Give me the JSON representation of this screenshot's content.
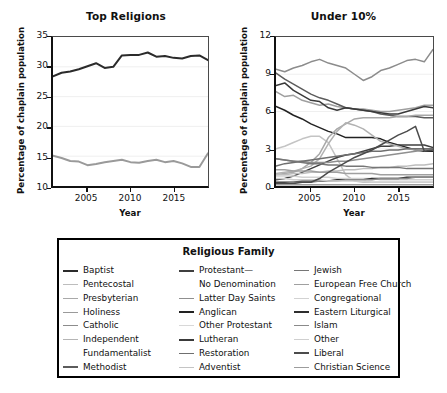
{
  "chart_data": [
    {
      "type": "line",
      "title": "Top Religions",
      "xlabel": "Year",
      "ylabel": "Percentage of chaplain population",
      "xlim": [
        2001,
        2019
      ],
      "ylim": [
        10,
        35
      ],
      "yticks": [
        10,
        15,
        20,
        25,
        30,
        35
      ],
      "xticks": [
        2005,
        2010,
        2015
      ],
      "grid": true,
      "legend_position": "below-shared",
      "x": [
        2001,
        2002,
        2003,
        2004,
        2005,
        2006,
        2007,
        2008,
        2009,
        2010,
        2011,
        2012,
        2013,
        2014,
        2015,
        2016,
        2017,
        2018,
        2019
      ],
      "series": [
        {
          "name": "Baptist",
          "color": "#2b2b2b",
          "values": [
            28.4,
            29.0,
            29.2,
            29.6,
            30.1,
            30.6,
            29.8,
            30.0,
            31.9,
            32.0,
            32.0,
            32.4,
            31.7,
            31.8,
            31.5,
            31.4,
            31.8,
            31.9,
            31.1
          ]
        },
        {
          "name": "Catholic",
          "color": "#9a9a9a",
          "values": [
            15.1,
            14.7,
            14.2,
            14.1,
            13.5,
            13.7,
            14.0,
            14.2,
            14.4,
            14.0,
            13.9,
            14.2,
            14.4,
            14.0,
            14.2,
            13.8,
            13.2,
            13.2,
            15.5
          ]
        }
      ]
    },
    {
      "type": "line",
      "title": "Under 10%",
      "xlabel": "Year",
      "ylabel": "Percentage of chaplain population",
      "xlim": [
        2001,
        2019
      ],
      "ylim": [
        0,
        12
      ],
      "yticks": [
        0,
        3,
        6,
        9,
        12
      ],
      "xticks": [
        2005,
        2010,
        2015
      ],
      "grid": true,
      "legend_position": "below-shared",
      "x": [
        2001,
        2002,
        2003,
        2004,
        2005,
        2006,
        2007,
        2008,
        2009,
        2010,
        2011,
        2012,
        2013,
        2014,
        2015,
        2016,
        2017,
        2018,
        2019
      ],
      "series": [
        {
          "name": "Pentecostal",
          "color": "#8c8c8c",
          "values": [
            9.4,
            9.2,
            9.5,
            9.7,
            10.0,
            10.2,
            9.9,
            9.7,
            9.5,
            9.0,
            8.5,
            8.8,
            9.3,
            9.5,
            9.8,
            10.1,
            10.2,
            10.0,
            11.0
          ]
        },
        {
          "name": "Presbyterian",
          "color": "#9f9f9f",
          "values": [
            7.6,
            7.2,
            7.3,
            6.9,
            6.7,
            6.5,
            6.6,
            6.4,
            6.3,
            6.2,
            6.2,
            6.1,
            6.0,
            6.0,
            6.1,
            6.2,
            6.3,
            6.5,
            6.5
          ]
        },
        {
          "name": "Methodist",
          "color": "#5c5c5c",
          "values": [
            9.1,
            8.6,
            8.2,
            7.8,
            7.4,
            7.1,
            6.9,
            6.6,
            6.3,
            6.2,
            6.1,
            6.0,
            5.8,
            5.7,
            5.6,
            5.6,
            5.6,
            5.5,
            5.5
          ]
        },
        {
          "name": "Lutheran",
          "color": "#3a3a3a",
          "values": [
            8.1,
            8.3,
            7.7,
            7.3,
            6.9,
            6.8,
            6.3,
            6.1,
            6.3,
            6.2,
            6.1,
            6.0,
            5.9,
            5.8,
            5.8,
            6.0,
            6.2,
            6.4,
            6.3
          ]
        },
        {
          "name": "Anglican",
          "color": "#222222",
          "values": [
            6.4,
            6.1,
            5.7,
            5.4,
            5.0,
            4.7,
            4.4,
            4.2,
            3.9,
            3.9,
            3.9,
            3.9,
            3.8,
            3.5,
            3.3,
            3.1,
            2.9,
            2.8,
            2.8
          ]
        },
        {
          "name": "Other Protestant",
          "color": "#c4c4c4",
          "values": [
            3.0,
            3.2,
            3.5,
            3.8,
            4.0,
            4.0,
            3.5,
            2.2,
            0.9,
            0.4,
            0.3,
            0.3,
            0.3,
            0.3,
            0.3,
            0.3,
            0.3,
            0.3,
            0.3
          ]
        },
        {
          "name": "Protestant— No Denomination",
          "color": "#3f3f3f",
          "values": [
            0.5,
            0.6,
            0.8,
            1.1,
            1.4,
            1.7,
            2.0,
            2.3,
            2.5,
            2.6,
            2.8,
            3.0,
            3.2,
            3.2,
            3.3,
            3.3,
            3.3,
            3.3,
            3.1
          ]
        },
        {
          "name": "Holiness",
          "color": "#a8a8a8",
          "values": [
            0.9,
            1.0,
            1.1,
            1.4,
            1.9,
            2.6,
            3.9,
            4.6,
            5.0,
            5.4,
            5.5,
            5.5,
            5.5,
            5.5,
            5.6,
            5.6,
            5.7,
            5.7,
            5.7
          ]
        },
        {
          "name": "Independent Fundamentalist",
          "color": "#b2b2b2",
          "values": [
            1.0,
            1.1,
            1.2,
            1.4,
            1.6,
            2.2,
            3.4,
            4.4,
            5.1,
            4.9,
            4.6,
            4.1,
            3.6,
            3.4,
            3.2,
            3.0,
            2.9,
            2.9,
            2.9
          ]
        },
        {
          "name": "Latter Day Saints",
          "color": "#8f8f8f",
          "values": [
            2.2,
            2.1,
            2.0,
            2.0,
            1.9,
            1.9,
            1.9,
            2.0,
            2.0,
            2.1,
            2.2,
            2.3,
            2.4,
            2.5,
            2.6,
            2.7,
            2.8,
            2.9,
            3.0
          ]
        },
        {
          "name": "Restoration",
          "color": "#6f6f6f",
          "values": [
            1.6,
            1.8,
            1.9,
            2.0,
            2.1,
            2.2,
            2.3,
            2.4,
            2.5,
            2.6,
            2.7,
            2.8,
            2.8,
            2.9,
            2.9,
            3.0,
            3.0,
            3.0,
            3.0
          ]
        },
        {
          "name": "Adventist",
          "color": "#bdbdbd",
          "values": [
            0.9,
            0.9,
            1.0,
            1.0,
            1.1,
            1.1,
            1.2,
            1.2,
            1.3,
            1.3,
            1.4,
            1.4,
            1.5,
            1.5,
            1.6,
            1.6,
            1.7,
            1.7,
            1.8
          ]
        },
        {
          "name": "Jewish",
          "color": "#767676",
          "values": [
            2.2,
            2.1,
            2.0,
            1.9,
            1.8,
            1.8,
            1.7,
            1.7,
            1.6,
            1.6,
            1.6,
            1.5,
            1.5,
            1.5,
            1.5,
            1.4,
            1.4,
            1.4,
            1.4
          ]
        },
        {
          "name": "European Free Church",
          "color": "#a0a0a0",
          "values": [
            1.3,
            1.3,
            1.2,
            1.2,
            1.2,
            1.1,
            1.1,
            1.1,
            1.0,
            1.0,
            1.0,
            1.0,
            0.9,
            0.9,
            0.9,
            0.9,
            0.9,
            0.9,
            0.9
          ]
        },
        {
          "name": "Congregational",
          "color": "#d2d2d2",
          "values": [
            0.8,
            0.8,
            0.8,
            0.7,
            0.7,
            0.7,
            0.7,
            0.6,
            0.6,
            0.6,
            0.6,
            0.6,
            0.5,
            0.5,
            0.5,
            0.5,
            0.5,
            0.5,
            0.5
          ]
        },
        {
          "name": "Eastern Liturgical",
          "color": "#2e2e2e",
          "values": [
            0.3,
            0.3,
            0.3,
            0.4,
            0.4,
            0.4,
            0.4,
            0.5,
            0.5,
            0.5,
            0.5,
            0.6,
            0.6,
            0.6,
            0.6,
            0.7,
            0.7,
            0.7,
            0.7
          ]
        },
        {
          "name": "Islam",
          "color": "#8a8a8a",
          "values": [
            0.2,
            0.2,
            0.3,
            0.3,
            0.3,
            0.4,
            0.4,
            0.4,
            0.5,
            0.5,
            0.5,
            0.5,
            0.6,
            0.6,
            0.6,
            0.6,
            0.7,
            0.7,
            0.7
          ]
        },
        {
          "name": "Other",
          "color": "#cfcfcf",
          "values": [
            0.6,
            0.6,
            0.5,
            0.5,
            0.5,
            0.5,
            0.4,
            0.4,
            0.4,
            0.4,
            0.4,
            0.3,
            0.3,
            0.3,
            0.3,
            0.3,
            0.3,
            0.3,
            0.3
          ]
        },
        {
          "name": "Liberal",
          "color": "#4b4b4b",
          "values": [
            0.2,
            0.2,
            0.2,
            0.3,
            0.3,
            0.6,
            1.1,
            1.5,
            1.9,
            2.3,
            2.6,
            2.9,
            3.3,
            3.7,
            4.1,
            4.4,
            4.8,
            2.8,
            2.9
          ]
        },
        {
          "name": "Christian Science",
          "color": "#9c9c9c",
          "values": [
            0.1,
            0.1,
            0.1,
            0.1,
            0.1,
            0.1,
            0.1,
            0.1,
            0.1,
            0.1,
            0.1,
            0.1,
            0.1,
            0.1,
            0.1,
            0.1,
            0.1,
            0.1,
            0.1
          ]
        }
      ]
    }
  ],
  "left_chart": {
    "title": "Top Religions",
    "xlabel": "Year",
    "ylabel": "Percentage of chaplain population",
    "yticks": [
      "35",
      "30",
      "25",
      "20",
      "15",
      "10"
    ],
    "xticks": [
      "2005",
      "2010",
      "2015"
    ]
  },
  "right_chart": {
    "title": "Under 10%",
    "xlabel": "Year",
    "ylabel": "Percentage of chaplain population",
    "yticks": [
      "12",
      "9",
      "6",
      "3",
      "0"
    ],
    "xticks": [
      "2005",
      "2010",
      "2015"
    ]
  },
  "legend": {
    "title": "Religious Family",
    "columns": [
      {
        "items": [
          {
            "label": "Baptist",
            "color": "#2b2b2b",
            "width": 2.4,
            "swatch": true
          },
          {
            "label": "Pentecostal",
            "color": "#bdbdbd",
            "width": 1.7,
            "swatch": true
          },
          {
            "label": "Presbyterian",
            "color": "#a9a9a9",
            "width": 1.7,
            "swatch": true
          },
          {
            "label": "Holiness",
            "color": "#9a9a9a",
            "width": 1.7,
            "swatch": true
          },
          {
            "label": "Catholic",
            "color": "#8c8c8c",
            "width": 1.7,
            "swatch": true
          },
          {
            "label": "Independent",
            "color": "#b5b5b5",
            "width": 1.7,
            "swatch": true
          },
          {
            "label": "Fundamentalist",
            "color": "#000000",
            "width": 0,
            "swatch": false
          },
          {
            "label": "Methodist",
            "color": "#5c5c5c",
            "width": 2.0,
            "swatch": true
          }
        ]
      },
      {
        "items": [
          {
            "label": "Protestant—",
            "color": "#3f3f3f",
            "width": 2.0,
            "swatch": true
          },
          {
            "label": "No Denomination",
            "color": "#000000",
            "width": 0,
            "swatch": false
          },
          {
            "label": "Latter Day Saints",
            "color": "#8f8f8f",
            "width": 1.7,
            "swatch": true
          },
          {
            "label": "Anglican",
            "color": "#222222",
            "width": 2.4,
            "swatch": true
          },
          {
            "label": "Other Protestant",
            "color": "#d8d8d8",
            "width": 1.7,
            "swatch": true
          },
          {
            "label": "Lutheran",
            "color": "#3a3a3a",
            "width": 2.4,
            "swatch": true
          },
          {
            "label": "Restoration",
            "color": "#6f6f6f",
            "width": 1.9,
            "swatch": true
          },
          {
            "label": "Adventist",
            "color": "#c4c4c4",
            "width": 1.7,
            "swatch": true
          }
        ]
      },
      {
        "items": [
          {
            "label": "Jewish",
            "color": "#767676",
            "width": 1.9,
            "swatch": true
          },
          {
            "label": "European Free Church",
            "color": "#a0a0a0",
            "width": 1.7,
            "swatch": true
          },
          {
            "label": "Congregational",
            "color": "#d2d2d2",
            "width": 1.7,
            "swatch": true
          },
          {
            "label": "Eastern Liturgical",
            "color": "#2e2e2e",
            "width": 2.4,
            "swatch": true
          },
          {
            "label": "Islam",
            "color": "#8a8a8a",
            "width": 1.7,
            "swatch": true
          },
          {
            "label": "Other",
            "color": "#cfcfcf",
            "width": 1.7,
            "swatch": true
          },
          {
            "label": "Liberal",
            "color": "#4b4b4b",
            "width": 2.2,
            "swatch": true
          },
          {
            "label": "Christian Science",
            "color": "#9c9c9c",
            "width": 1.9,
            "swatch": true
          }
        ]
      }
    ]
  }
}
